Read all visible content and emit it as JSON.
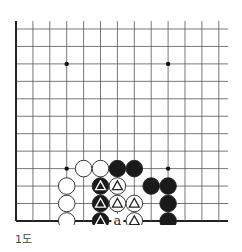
{
  "caption": "1도",
  "board": {
    "origin_x": 16,
    "origin_y": 29,
    "spacing_x": 16.9,
    "spacing_y": 17.45,
    "cols": 13,
    "rows": 12,
    "right_extend": 228,
    "top_extend": 21,
    "left_edge_thick": true,
    "bottom_edge_thick": true,
    "line_color": "#555555",
    "edge_color": "#222222",
    "stone_black": "#1a1a1a",
    "stone_white": "#ffffff",
    "star_points": [
      [
        3,
        2
      ],
      [
        9,
        2
      ],
      [
        3,
        8
      ],
      [
        9,
        8
      ]
    ],
    "stones": [
      {
        "col": 4,
        "row": 8,
        "color": "white",
        "mark": ""
      },
      {
        "col": 5,
        "row": 8,
        "color": "white",
        "mark": ""
      },
      {
        "col": 6,
        "row": 8,
        "color": "black",
        "mark": ""
      },
      {
        "col": 7,
        "row": 8,
        "color": "black",
        "mark": ""
      },
      {
        "col": 3,
        "row": 9,
        "color": "white",
        "mark": ""
      },
      {
        "col": 5,
        "row": 9,
        "color": "black",
        "mark": "triangle"
      },
      {
        "col": 6,
        "row": 9,
        "color": "white",
        "mark": "triangle"
      },
      {
        "col": 8,
        "row": 9,
        "color": "black",
        "mark": ""
      },
      {
        "col": 9,
        "row": 9,
        "color": "black",
        "mark": ""
      },
      {
        "col": 3,
        "row": 10,
        "color": "white",
        "mark": ""
      },
      {
        "col": 5,
        "row": 10,
        "color": "black",
        "mark": "triangle"
      },
      {
        "col": 6,
        "row": 10,
        "color": "white",
        "mark": "triangle"
      },
      {
        "col": 7,
        "row": 10,
        "color": "white",
        "mark": "triangle"
      },
      {
        "col": 9,
        "row": 10,
        "color": "black",
        "mark": ""
      },
      {
        "col": 3,
        "row": 11,
        "color": "white",
        "mark": ""
      },
      {
        "col": 5,
        "row": 11,
        "color": "black",
        "mark": "triangle"
      },
      {
        "col": 7,
        "row": 11,
        "color": "white",
        "mark": "triangle"
      },
      {
        "col": 9,
        "row": 11,
        "color": "black",
        "mark": ""
      }
    ],
    "labels": [
      {
        "col": 6,
        "row": 11,
        "text": "a"
      }
    ]
  }
}
